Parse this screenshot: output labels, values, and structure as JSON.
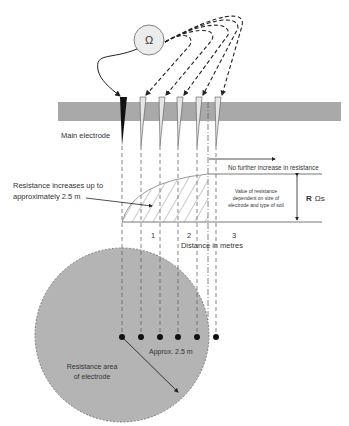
{
  "meter": {
    "symbol": "Ω"
  },
  "labels": {
    "main_electrode": "Main electrode",
    "no_further_increase": "No further increase in resistance",
    "increase_line1": "Resistance increases up to",
    "increase_line2": "approximately 2.5 m",
    "value_line1": "Value of resistance",
    "value_line2": "dependent on size of",
    "value_line3": "electrode and type of soil",
    "r_bold": "R",
    "r_unit": "Ωs",
    "distance_axis": "Distance in metres",
    "approx": "Approx. 2.5 m",
    "area_line1": "Resistance area",
    "area_line2": "of electrode"
  },
  "axis_ticks": [
    "1",
    "2",
    "3"
  ],
  "colors": {
    "ground": "#a9a9a9",
    "area": "#b4b4b4",
    "meter_fill": "#ececec",
    "line": "#333333"
  }
}
